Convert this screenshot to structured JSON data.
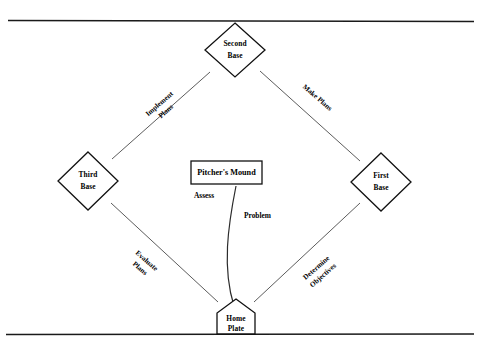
{
  "diagram": {
    "colors": {
      "ink": "#111111",
      "edge": "#4a4a4a",
      "rule": "#1a1a1a",
      "background": "#ffffff"
    },
    "rules": {
      "top_label": "top-horizontal-rule",
      "bottom_label": "bottom-horizontal-rule"
    },
    "nodes": [
      {
        "id": "second-base",
        "shape": "diamond",
        "line1": "Second",
        "line2": "Base",
        "cx": 235,
        "cy": 50
      },
      {
        "id": "third-base",
        "shape": "diamond",
        "line1": "Third",
        "line2": "Base",
        "cx": 88,
        "cy": 181
      },
      {
        "id": "first-base",
        "shape": "diamond",
        "line1": "First",
        "line2": "Base",
        "cx": 381,
        "cy": 182
      },
      {
        "id": "home-plate",
        "shape": "pentagon",
        "line1": "Home",
        "line2": "Plate",
        "cx": 236,
        "cy": 318
      }
    ],
    "center_box": {
      "id": "pitchers-mound",
      "label": "Pitcher's Mound",
      "x": 191,
      "y": 161,
      "width": 71,
      "height": 23
    },
    "edges": [
      {
        "id": "implement-plans",
        "label": "Implement Plans",
        "line1": "Implement",
        "line2": "Plans",
        "from": "third-base",
        "to": "second-base",
        "rotation": -41
      },
      {
        "id": "make-plans",
        "label": "Make Plans",
        "line1": "Make Plans",
        "line2": "",
        "from": "second-base",
        "to": "first-base",
        "rotation": 41
      },
      {
        "id": "determine-objectives",
        "label": "Determine Objectives",
        "line1": "Determine",
        "line2": "Objectives",
        "from": "home-plate",
        "to": "first-base",
        "rotation": -41
      },
      {
        "id": "evaluate-plans",
        "label": "Evaluate Plans",
        "line1": "Evaluate",
        "line2": "Plans",
        "from": "home-plate",
        "to": "third-base",
        "rotation": 41
      }
    ],
    "center_labels": [
      {
        "id": "assess",
        "label": "Assess",
        "x": 194,
        "y": 196
      },
      {
        "id": "problem",
        "label": "Problem",
        "x": 244,
        "y": 216
      }
    ]
  }
}
